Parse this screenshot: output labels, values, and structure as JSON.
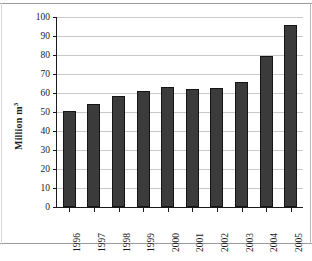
{
  "chart_data": {
    "type": "bar",
    "title": "",
    "xlabel": "",
    "ylabel": "Million m",
    "ylabel_superscript": "3",
    "categories": [
      "1996",
      "1997",
      "1998",
      "1999",
      "2000",
      "2001",
      "2002",
      "2003",
      "2004",
      "2005"
    ],
    "values": [
      50.5,
      54,
      58.5,
      61,
      63,
      62.3,
      62.5,
      66,
      79.3,
      96
    ],
    "ylim": [
      0,
      100
    ],
    "ytick_step": 10,
    "yticks": [
      "0",
      "10",
      "20",
      "30",
      "40",
      "50",
      "60",
      "70",
      "80",
      "90",
      "100"
    ],
    "grid": true,
    "grid_axis": "y",
    "legend": "none",
    "bar_color": "#3b3b3b",
    "bar_edge_color": "#141414",
    "grid_color": "#c9c9c9",
    "axis_color": "#1a1a1a"
  }
}
